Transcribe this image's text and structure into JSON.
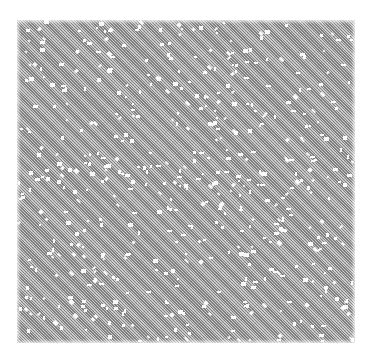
{
  "image": {
    "description": "Square dithered gray noise texture with scattered white specks",
    "background_color": "#ffffff",
    "texture": {
      "x": 17,
      "y": 20,
      "width": 338,
      "height": 323,
      "base_color": "#b8b8b8",
      "hatch_color": "#787878",
      "speck_color": "#ffffff",
      "speck_count": 520,
      "seed": 73
    }
  }
}
